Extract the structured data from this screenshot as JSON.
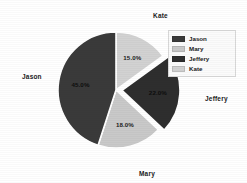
{
  "chart_data": {
    "type": "pie",
    "title": "",
    "labels": [
      "Jason",
      "Mary",
      "Jeffery",
      "Kate"
    ],
    "values": [
      45.0,
      18.0,
      22.0,
      15.0
    ],
    "value_labels": [
      "45.0%",
      "18.0%",
      "22.0%",
      "15.0%"
    ],
    "colors": [
      "#3a3a3a",
      "#c9c9c9",
      "#2e2e2e",
      "#d2d2d2"
    ],
    "exploded": [
      false,
      false,
      true,
      false
    ],
    "autopct": "%1.1f%%",
    "startangle": 90,
    "counterclock": false,
    "legend_position": "upper right",
    "grid": false,
    "background": "#ffffff",
    "slices": [
      {
        "name": "Kate",
        "percent": 15.0,
        "percent_label": "15.0%",
        "color": "#d2d2d2",
        "start_deg": 0.0,
        "end_deg": 54.0,
        "exploded": false,
        "outer_label": "Kate"
      },
      {
        "name": "Jeffery",
        "percent": 22.0,
        "percent_label": "22.0%",
        "color": "#2e2e2e",
        "start_deg": 54.0,
        "end_deg": 133.2,
        "exploded": true,
        "outer_label": "Jeffery"
      },
      {
        "name": "Mary",
        "percent": 18.0,
        "percent_label": "18.0%",
        "color": "#c9c9c9",
        "start_deg": 133.2,
        "end_deg": 198.0,
        "exploded": false,
        "outer_label": "Mary"
      },
      {
        "name": "Jason",
        "percent": 45.0,
        "percent_label": "45.0%",
        "color": "#3a3a3a",
        "start_deg": 198.0,
        "end_deg": 360.0,
        "exploded": false,
        "outer_label": "Jason"
      }
    ]
  },
  "outer_labels": {
    "top": "Kate",
    "right": "Jeffery",
    "bottom": "Mary",
    "left": "Jason"
  },
  "percent_labels": {
    "kate": "15.0%",
    "jeffery": "22.0%",
    "mary": "18.0%",
    "jason": "45.0%"
  },
  "legend": {
    "items": [
      {
        "label": "Jason",
        "color": "#3a3a3a"
      },
      {
        "label": "Mary",
        "color": "#c9c9c9"
      },
      {
        "label": "Jeffery",
        "color": "#2e2e2e"
      },
      {
        "label": "Kate",
        "color": "#d2d2d2"
      }
    ]
  }
}
